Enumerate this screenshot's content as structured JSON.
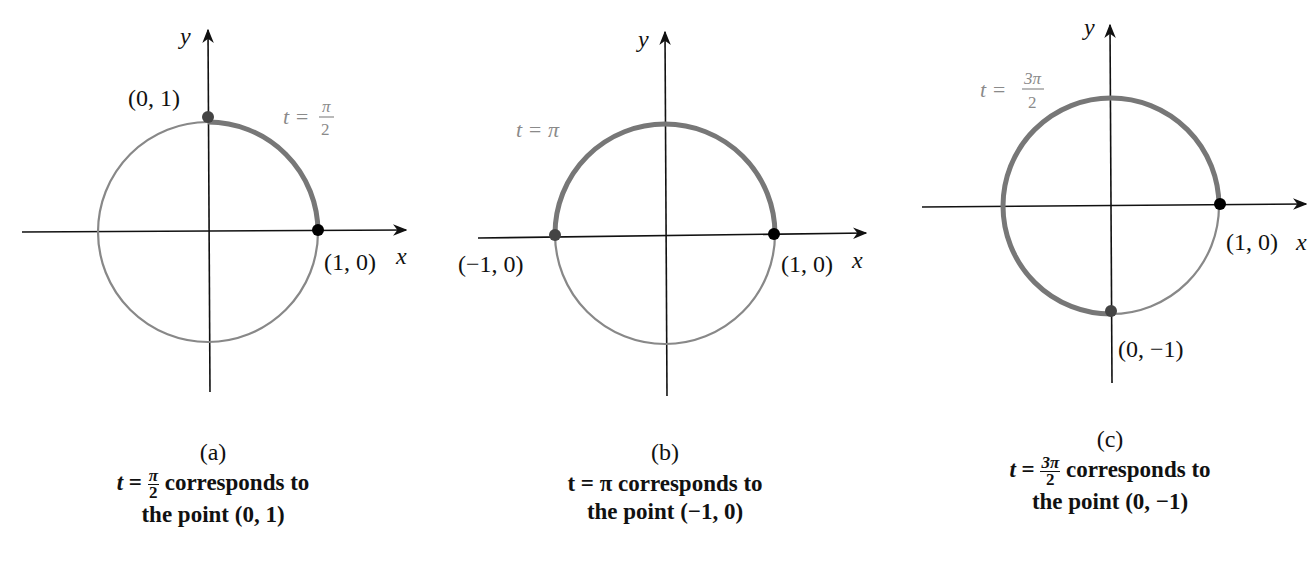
{
  "colors": {
    "axis": "#111111",
    "circle": "#888888",
    "arc": "#7a7a7a",
    "start_dot": "#000000",
    "end_dot": "#444444",
    "t_label": "#8a8a8a"
  },
  "panels": [
    {
      "id": "a",
      "sub_label": "(a)",
      "axis_x_label": "x",
      "axis_y_label": "y",
      "start_point_label": "(1, 0)",
      "end_point_label": "(0, 1)",
      "t_label_prefix": "t =",
      "t_label_num": "π",
      "t_label_den": "2",
      "caption_t": "t",
      "caption_eq": " = ",
      "caption_num": "π",
      "caption_den": "2",
      "caption_rest": " corresponds to",
      "caption_line2": "the point (0, 1)"
    },
    {
      "id": "b",
      "sub_label": "(b)",
      "axis_x_label": "x",
      "axis_y_label": "y",
      "start_point_label": "(1, 0)",
      "end_point_label": "(−1, 0)",
      "t_label": "t = π",
      "caption_line1": "t = π corresponds to",
      "caption_line2": "the point (−1, 0)"
    },
    {
      "id": "c",
      "sub_label": "(c)",
      "axis_x_label": "x",
      "axis_y_label": "y",
      "start_point_label": "(1, 0)",
      "end_point_label": "(0, −1)",
      "t_label_prefix": "t =",
      "t_label_num": "3π",
      "t_label_den": "2",
      "caption_t": "t",
      "caption_eq": " = ",
      "caption_num": "3π",
      "caption_den": "2",
      "caption_rest": " corresponds to",
      "caption_line2": "the point (0, −1)"
    }
  ]
}
